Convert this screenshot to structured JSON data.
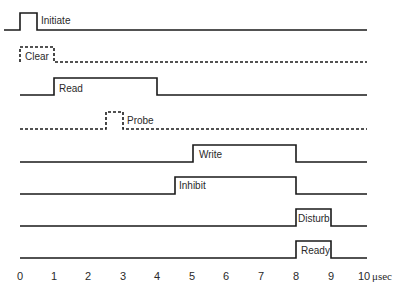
{
  "diagram": {
    "type": "timing-diagram",
    "x_axis": {
      "min": 0,
      "max": 10,
      "ticks": [
        "0",
        "1",
        "2",
        "3",
        "4",
        "5",
        "6",
        "7",
        "8",
        "9",
        "10"
      ],
      "unit": "μsec"
    },
    "signals": [
      {
        "name": "Initiate",
        "style": "solid",
        "start": 0,
        "end": 0.5
      },
      {
        "name": "Clear",
        "style": "dashed",
        "start": 0,
        "end": 1
      },
      {
        "name": "Read",
        "style": "solid",
        "start": 1,
        "end": 4
      },
      {
        "name": "Probe",
        "style": "dashed",
        "start": 2.5,
        "end": 3
      },
      {
        "name": "Write",
        "style": "solid",
        "start": 5,
        "end": 8
      },
      {
        "name": "Inhibit",
        "style": "solid",
        "start": 4.5,
        "end": 8
      },
      {
        "name": "Disturb",
        "style": "solid",
        "start": 8,
        "end": 9
      },
      {
        "name": "Ready",
        "style": "solid",
        "start": 8,
        "end": 9
      }
    ]
  },
  "labels": {
    "initiate": "Initiate",
    "clear": "Clear",
    "read": "Read",
    "probe": "Probe",
    "write": "Write",
    "inhibit": "Inhibit",
    "disturb": "Disturb",
    "ready": "Ready",
    "unit": "μsec",
    "ticks": [
      "0",
      "1",
      "2",
      "3",
      "4",
      "5",
      "6",
      "7",
      "8",
      "9",
      "10"
    ]
  }
}
